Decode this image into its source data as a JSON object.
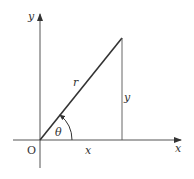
{
  "diagram": {
    "labels": {
      "x_axis": "x",
      "y_axis": "y",
      "origin": "O",
      "radius": "r",
      "angle": "θ",
      "horizontal_leg": "x",
      "vertical_leg": "y"
    },
    "colors": {
      "axis": "#444444",
      "line": "#333333",
      "text": "#333333"
    }
  }
}
